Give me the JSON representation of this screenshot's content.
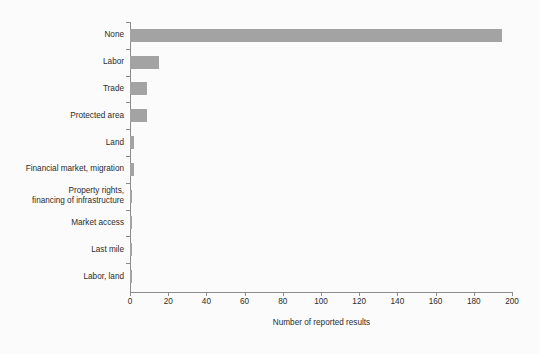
{
  "chart_data": {
    "type": "bar",
    "orientation": "horizontal",
    "title": "",
    "xlabel": "Number of reported results",
    "ylabel": "",
    "xlim": [
      0,
      200
    ],
    "ylim": null,
    "grid": false,
    "legend": null,
    "bar_color": "#a3a3a3",
    "axis_color": "#8c8c8c",
    "background_color": "#fbfbfb",
    "xticks": [
      0,
      20,
      40,
      60,
      80,
      100,
      120,
      140,
      160,
      180,
      200
    ],
    "xtick_labels": [
      "0",
      "20",
      "40",
      "60",
      "80",
      "100",
      "120",
      "140",
      "160",
      "180",
      "200"
    ],
    "categories": [
      "None",
      "Labor",
      "Trade",
      "Protected area",
      "Land",
      "Financial market, migration",
      "Property rights,\nfinancing of infrastructure",
      "Market access",
      "Last mile",
      "Labor, land"
    ],
    "values": [
      195,
      15,
      9,
      9,
      2,
      2,
      1,
      1,
      1,
      1
    ]
  },
  "footer": {
    "source_note": ""
  }
}
